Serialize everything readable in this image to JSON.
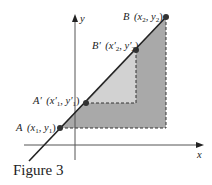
{
  "figure": {
    "caption": "Figure 3",
    "axes": {
      "x_label": "x",
      "y_label": "y"
    },
    "points": [
      {
        "id": "A",
        "name": "A",
        "coords_text": "(x",
        "sub1": "1",
        "sep": ", y",
        "sub2": "1",
        "close": ")"
      },
      {
        "id": "A_prime",
        "name": "A′",
        "coords_text": "(x′",
        "sub1": "1",
        "sep": ", y′",
        "sub2": "1",
        "close": ")"
      },
      {
        "id": "B_prime",
        "name": "B′",
        "coords_text": "(x′",
        "sub1": "2",
        "sep": ", y′",
        "sub2": "2",
        "close": ")"
      },
      {
        "id": "B",
        "name": "B",
        "coords_text": "(x",
        "sub1": "2",
        "sep": ", y",
        "sub2": "2",
        "close": ")"
      }
    ],
    "colors": {
      "outer_region": "#a8a8a8",
      "inner_region": "#cfcfcf",
      "line": "#222222",
      "point": "#333333",
      "dashed": "#333333"
    }
  }
}
